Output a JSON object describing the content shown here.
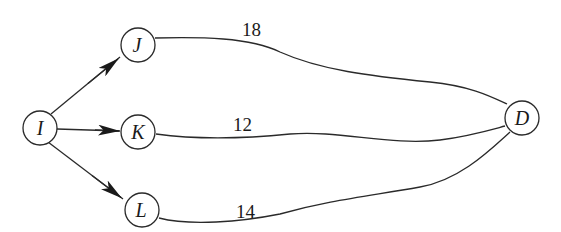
{
  "diagram": {
    "type": "network-graph",
    "nodes": [
      {
        "id": "I",
        "label": "I"
      },
      {
        "id": "J",
        "label": "J"
      },
      {
        "id": "K",
        "label": "K"
      },
      {
        "id": "L",
        "label": "L"
      },
      {
        "id": "D",
        "label": "D"
      }
    ],
    "edges": [
      {
        "from": "I",
        "to": "J",
        "directed": true,
        "weight": ""
      },
      {
        "from": "I",
        "to": "K",
        "directed": true,
        "weight": ""
      },
      {
        "from": "I",
        "to": "L",
        "directed": true,
        "weight": ""
      },
      {
        "from": "J",
        "to": "D",
        "directed": false,
        "weight": "18"
      },
      {
        "from": "K",
        "to": "D",
        "directed": false,
        "weight": "12"
      },
      {
        "from": "L",
        "to": "D",
        "directed": false,
        "weight": "14"
      }
    ],
    "colors": {
      "stroke": "#2a2a2a",
      "background": "#ffffff"
    }
  }
}
